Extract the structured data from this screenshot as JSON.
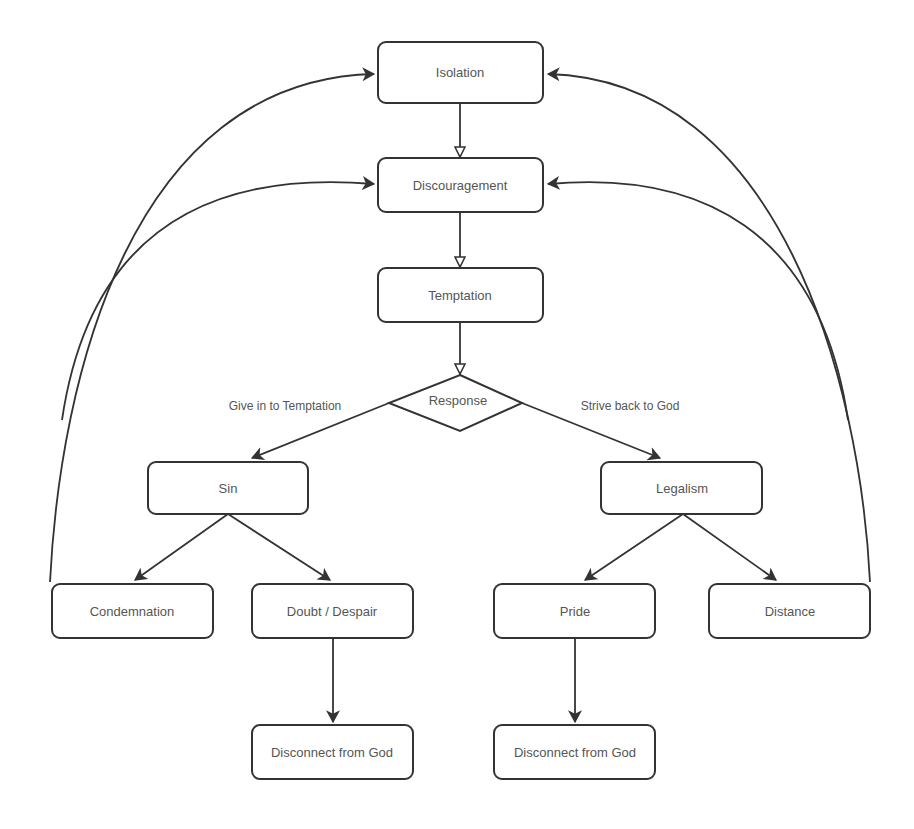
{
  "diagram": {
    "nodes": {
      "isolation": "Isolation",
      "discouragement": "Discouragement",
      "temptation": "Temptation",
      "response": "Response",
      "sin": "Sin",
      "legalism": "Legalism",
      "condemnation": "Condemnation",
      "doubt_despair": "Doubt / Despair",
      "pride": "Pride",
      "distance": "Distance",
      "disconnect_left": "Disconnect from God",
      "disconnect_right": "Disconnect from God"
    },
    "edge_labels": {
      "give_in": "Give in to Temptation",
      "strive_back": "Strive back to God"
    },
    "colors": {
      "stroke": "#333333",
      "text": "#555555",
      "background": "#ffffff"
    }
  }
}
